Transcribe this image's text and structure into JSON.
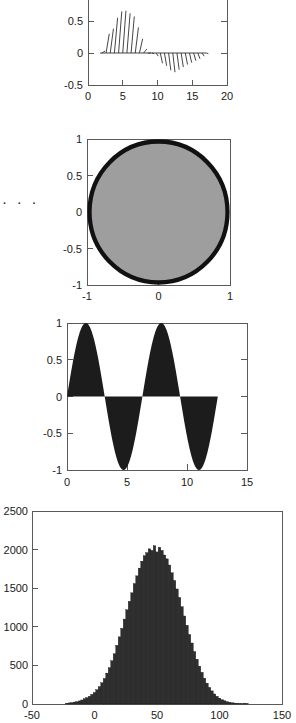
{
  "page": {
    "width": 296,
    "height": 723,
    "background": "#ffffff",
    "ellipsis": "· · ·"
  },
  "colors": {
    "axis": "#5a5a5a",
    "text": "#1a1a1a",
    "quiver": "#303030",
    "circle_fill": "#9e9e9e",
    "circle_stroke": "#111111",
    "sine_fill": "#1c1c1c",
    "hist_fill": "#2e2e2e"
  },
  "chart_data": [
    {
      "id": "quiver-plot",
      "type": "scatter",
      "title": "",
      "xlabel": "",
      "ylabel": "",
      "xlim": [
        0,
        20
      ],
      "ylim": [
        -0.5,
        0.75
      ],
      "xticks": [
        0,
        5,
        10,
        15,
        20
      ],
      "xticklabels": [
        "0",
        "5",
        "10",
        "15",
        "20"
      ],
      "yticks": [
        -0.5,
        0,
        0.5
      ],
      "yticklabels": [
        "-0.5",
        "0",
        "0.5"
      ],
      "grid": false,
      "legend": null,
      "description": "Quiver / arrow stem plot of a damped sine: slanted vectors rising from the y=0 baseline",
      "x": [
        2,
        2.6,
        3.2,
        3.8,
        4.4,
        5.0,
        5.6,
        6.2,
        6.8,
        7.4,
        8.0,
        8.6,
        9.2,
        9.8,
        10.4,
        11.0,
        11.6,
        12.2,
        12.8,
        13.4,
        14.0,
        14.6,
        15.2,
        15.8,
        16.4,
        17.0
      ],
      "values": [
        0.03,
        0.3,
        0.38,
        0.55,
        0.65,
        0.66,
        0.62,
        0.57,
        0.4,
        0.22,
        0.06,
        0.0,
        -0.01,
        -0.05,
        -0.16,
        -0.2,
        -0.27,
        -0.3,
        -0.26,
        -0.22,
        -0.18,
        -0.15,
        -0.12,
        -0.09,
        -0.05,
        -0.01
      ]
    },
    {
      "id": "circle-plot",
      "type": "area",
      "title": "",
      "xlabel": "",
      "ylabel": "",
      "xlim": [
        -1,
        1
      ],
      "ylim": [
        -1,
        1
      ],
      "xticks": [
        -1,
        0,
        1
      ],
      "xticklabels": [
        "-1",
        "0",
        "1"
      ],
      "yticks": [
        -1,
        -0.5,
        0,
        0.5,
        1
      ],
      "yticklabels": [
        "-1",
        "-0.5",
        "0",
        "0.5",
        "1"
      ],
      "grid": false,
      "legend": null,
      "description": "Filled unit circle (gray fill, thick black outline) spanning the full axes",
      "shape": "circle",
      "center": [
        0,
        0
      ],
      "radius": 1.0,
      "fill": "#9e9e9e",
      "stroke": "#111111",
      "stroke_width_data": 0.06
    },
    {
      "id": "sine-fill-plot",
      "type": "area",
      "title": "",
      "xlabel": "",
      "ylabel": "",
      "xlim": [
        0,
        15
      ],
      "ylim": [
        -1,
        1
      ],
      "xticks": [
        0,
        5,
        10,
        15
      ],
      "xticklabels": [
        "0",
        "5",
        "10",
        "15"
      ],
      "yticks": [
        -1,
        -0.5,
        0,
        0.5,
        1
      ],
      "yticklabels": [
        "-1",
        "-0.5",
        "0",
        "0.5",
        "1"
      ],
      "grid": false,
      "legend": null,
      "description": "Two full cycles of sin(x) filled to the zero baseline, drawn from x=0 to x=12.57",
      "function": "sin(x)",
      "period": 6.2832,
      "amplitude": 1.0,
      "x_start": 0,
      "x_end": 12.566,
      "fill": "#1c1c1c"
    },
    {
      "id": "histogram-plot",
      "type": "bar",
      "title": "",
      "xlabel": "",
      "ylabel": "",
      "xlim": [
        -50,
        150
      ],
      "ylim": [
        0,
        2500
      ],
      "xticks": [
        -50,
        0,
        50,
        100,
        150
      ],
      "xticklabels": [
        "-50",
        "0",
        "50",
        "100",
        "150"
      ],
      "yticks": [
        0,
        500,
        1000,
        1500,
        2000,
        2500
      ],
      "yticklabels": [
        "0",
        "500",
        "1000",
        "1500",
        "2000",
        "2500"
      ],
      "grid": false,
      "legend": null,
      "description": "Histogram of a normal sample, mean about 50, standard deviation about 18, peak bin count about 2050",
      "distribution": "normal",
      "mean": 50,
      "std": 18,
      "peak_count": 2050,
      "bin_width": 2,
      "bin_centers": [
        -22,
        -20,
        -18,
        -16,
        -14,
        -12,
        -10,
        -8,
        -6,
        -4,
        -2,
        0,
        2,
        4,
        6,
        8,
        10,
        12,
        14,
        16,
        18,
        20,
        22,
        24,
        26,
        28,
        30,
        32,
        34,
        36,
        38,
        40,
        42,
        44,
        46,
        48,
        50,
        52,
        54,
        56,
        58,
        60,
        62,
        64,
        66,
        68,
        70,
        72,
        74,
        76,
        78,
        80,
        82,
        84,
        86,
        88,
        90,
        92,
        94,
        96,
        98,
        100,
        102,
        104,
        106,
        108,
        110,
        112,
        114,
        116,
        118,
        120,
        122
      ],
      "values": [
        10,
        14,
        18,
        25,
        30,
        40,
        52,
        68,
        82,
        100,
        125,
        150,
        185,
        225,
        275,
        330,
        400,
        470,
        560,
        650,
        760,
        870,
        980,
        1100,
        1220,
        1330,
        1440,
        1560,
        1660,
        1760,
        1850,
        1920,
        1960,
        2010,
        1990,
        2050,
        1970,
        2030,
        1990,
        1930,
        1880,
        1800,
        1700,
        1600,
        1490,
        1380,
        1260,
        1140,
        1020,
        900,
        790,
        680,
        580,
        490,
        410,
        335,
        270,
        215,
        170,
        130,
        100,
        76,
        56,
        42,
        30,
        22,
        16,
        12,
        9,
        7,
        5,
        8,
        6
      ]
    }
  ]
}
